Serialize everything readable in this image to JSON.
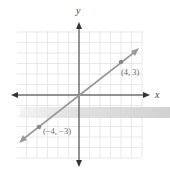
{
  "chart_data": {
    "type": "line",
    "title": "",
    "xlabel": "x",
    "ylabel": "y",
    "xlim": [
      -6,
      6
    ],
    "ylim": [
      -6,
      6
    ],
    "grid": true,
    "legend": null,
    "series": [
      {
        "name": "line through origin",
        "equation": "y = (3/4)x",
        "x": [
          -4,
          0,
          4
        ],
        "y": [
          -3,
          0,
          3
        ],
        "color": "#8a8a8a"
      }
    ],
    "points": [
      {
        "x": 4,
        "y": 3,
        "label": "(4, 3)"
      },
      {
        "x": -4,
        "y": -3,
        "label": "(−4, −3)"
      }
    ],
    "annotations": [
      "(4, 3)",
      "(−4, −3)"
    ]
  },
  "axes": {
    "x_label": "x",
    "y_label": "y"
  },
  "labels": {
    "point_a": "(4, 3)",
    "point_b": "(−4, −3)"
  },
  "colors": {
    "grid": "#e2e2e2",
    "axis": "#333333",
    "line": "#9a9a9a",
    "point": "#888888",
    "band": "#d6d6d6"
  }
}
